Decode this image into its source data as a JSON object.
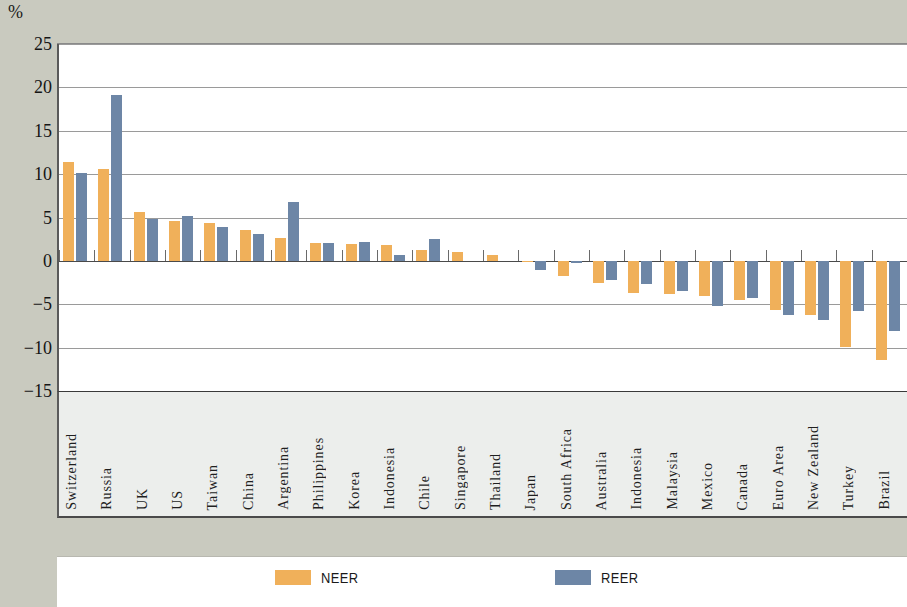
{
  "chart_data": {
    "type": "bar",
    "title": "",
    "subtitle": "",
    "xlabel": "",
    "ylabel": "%",
    "unit_label": "%",
    "ylim": [
      -15,
      25
    ],
    "yticks": [
      25,
      20,
      15,
      10,
      5,
      0,
      -5,
      -10,
      -15
    ],
    "ytick_labels": [
      "25",
      "20",
      "15",
      "10",
      "5",
      "0",
      "−5",
      "−10",
      "−15"
    ],
    "grid": true,
    "legend_position": "bottom",
    "categories": [
      "Switzerland",
      "Russia",
      "UK",
      "US",
      "Taiwan",
      "China",
      "Argentina",
      "Philippines",
      "Korea",
      "Indonesia",
      "Chile",
      "Singapore",
      "Thailand",
      "Japan",
      "South Africa",
      "Australia",
      "Indonesia",
      "Malaysia",
      "Mexico",
      "Canada",
      "Euro Area",
      "New Zealand",
      "Turkey",
      "Brazil"
    ],
    "series": [
      {
        "name": "NEER",
        "color": "#f0b05a",
        "values": [
          11.4,
          10.6,
          5.6,
          4.6,
          4.4,
          3.6,
          2.6,
          2.1,
          1.9,
          1.8,
          1.2,
          1.0,
          0.7,
          -0.1,
          -1.7,
          -2.6,
          -3.7,
          -3.8,
          -4.0,
          -4.5,
          -5.7,
          -6.2,
          -9.9,
          -11.4
        ]
      },
      {
        "name": "REER",
        "color": "#6d86a6",
        "values": [
          10.1,
          19.1,
          4.8,
          5.2,
          3.9,
          3.1,
          6.8,
          2.1,
          2.2,
          0.7,
          2.5,
          0.0,
          0.0,
          -1.0,
          -0.3,
          -2.2,
          -2.7,
          -3.5,
          -5.2,
          -4.3,
          -6.2,
          -6.8,
          -5.8,
          -8.1
        ]
      }
    ]
  },
  "legend": {
    "items": [
      {
        "label": "NEER",
        "color": "#f0b05a"
      },
      {
        "label": "REER",
        "color": "#6d86a6"
      }
    ]
  }
}
